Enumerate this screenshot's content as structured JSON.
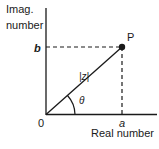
{
  "diagram": {
    "type": "complex-plane",
    "y_axis_label_line1": "Imag.",
    "y_axis_label_line2": "number",
    "x_axis_label": "Real number",
    "origin_label": "0",
    "point_label": "P",
    "b_label": "b",
    "a_label": "a",
    "magnitude_label": "|z|",
    "angle_label": "θ",
    "colors": {
      "ink": "#1a1a1a",
      "background": "#ffffff"
    }
  }
}
